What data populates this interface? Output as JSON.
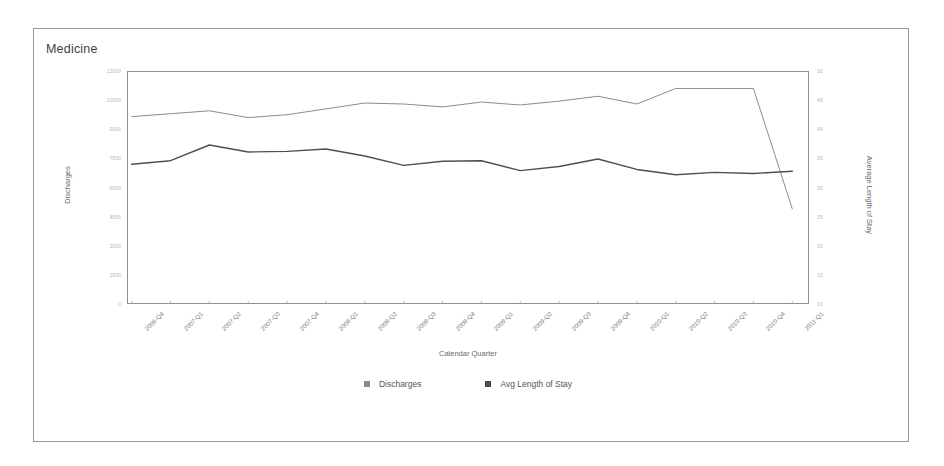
{
  "panel": {
    "title": "Medicine"
  },
  "chart_data": {
    "type": "line",
    "title": "Medicine",
    "xlabel": "Calendar Quarter",
    "ylabel": "Discharges",
    "y2label": "Average Length of Stay",
    "grid": false,
    "legend_position": "bottom",
    "categories": [
      "2006-Q4",
      "2007-Q1",
      "2007-Q2",
      "2007-Q3",
      "2007-Q4",
      "2008-Q1",
      "2008-Q2",
      "2008-Q3",
      "2008-Q4",
      "2009-Q1",
      "2009-Q2",
      "2009-Q3",
      "2009-Q4",
      "2010-Q1",
      "2010-Q2",
      "2010-Q3",
      "2010-Q4",
      "2011-Q1"
    ],
    "ylim": [
      0,
      12000
    ],
    "yticks": [
      "12000",
      "10500",
      "9000",
      "7500",
      "6000",
      "4500",
      "3000",
      "1500",
      "0"
    ],
    "y2lim": [
      10,
      50
    ],
    "y2ticks": [
      "50",
      "45",
      "40",
      "35",
      "30",
      "25",
      "20",
      "15",
      "10"
    ],
    "series": [
      {
        "name": "Discharges",
        "axis": "left",
        "color": "#8c8c8c",
        "values": [
          9650,
          9800,
          9950,
          9600,
          9750,
          10050,
          10350,
          10300,
          10150,
          10400,
          10250,
          10450,
          10700,
          10300,
          11100,
          11100,
          11100,
          4900
        ]
      },
      {
        "name": "Avg Length of Stay",
        "axis": "right",
        "color": "#4f4f4f",
        "values": [
          34.0,
          34.6,
          37.3,
          36.1,
          36.2,
          36.6,
          35.4,
          33.8,
          34.5,
          34.6,
          32.9,
          33.6,
          34.9,
          33.1,
          32.2,
          32.6,
          32.4,
          32.8
        ]
      }
    ]
  },
  "legend": {
    "items": [
      {
        "label": "Discharges",
        "color": "#8c8c8c"
      },
      {
        "label": "Avg Length of Stay",
        "color": "#4a4a4a"
      }
    ]
  }
}
